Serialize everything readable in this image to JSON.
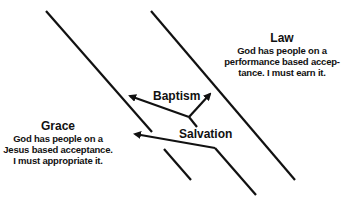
{
  "law": {
    "title": "Law",
    "line1": "God has people on a",
    "line2": "performance based accep-",
    "line3": "tance. I must earn it."
  },
  "grace": {
    "title": "Grace",
    "line1": "God has people on a",
    "line2": "Jesus based acceptance.",
    "line3": "I must appropriate it."
  },
  "arrows": {
    "baptism": "Baptism",
    "salvation": "Salvation"
  },
  "colors": {
    "ink": "#111111",
    "background": "#ffffff"
  }
}
